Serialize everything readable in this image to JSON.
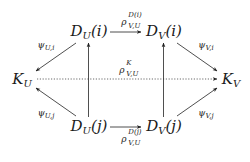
{
  "diagram": {
    "type": "commutative-diagram",
    "nodes": {
      "DUi": {
        "base": "D",
        "sub": "U",
        "arg": "(i)"
      },
      "DVi": {
        "base": "D",
        "sub": "V",
        "arg": "(i)"
      },
      "KU": {
        "base": "K",
        "sub": "U",
        "arg": ""
      },
      "KV": {
        "base": "K",
        "sub": "V",
        "arg": ""
      },
      "DUj": {
        "base": "D",
        "sub": "U",
        "arg": "(j)"
      },
      "DVj": {
        "base": "D",
        "sub": "V",
        "arg": "(j)"
      }
    },
    "edges": [
      {
        "from": "DUi",
        "to": "DVi",
        "style": "solid",
        "label": "ρ^{D(i)}_{V,U}"
      },
      {
        "from": "DUj",
        "to": "DVj",
        "style": "solid",
        "label": "ρ^{D(j)}_{V,U}"
      },
      {
        "from": "KU",
        "to": "KV",
        "style": "dotted",
        "label": "ρ^{K}_{V,U}"
      },
      {
        "from": "DUi",
        "to": "KU",
        "style": "solid",
        "label": "ψ_{U,i}"
      },
      {
        "from": "DVi",
        "to": "KV",
        "style": "solid",
        "label": "ψ_{V,i}"
      },
      {
        "from": "DUj",
        "to": "KU",
        "style": "solid",
        "label": "ψ_{U,j}"
      },
      {
        "from": "DVj",
        "to": "KV",
        "style": "solid",
        "label": "ψ_{V,j}"
      },
      {
        "from": "DUj",
        "to": "DUi",
        "style": "solid",
        "label": ""
      },
      {
        "from": "DVj",
        "to": "DVi",
        "style": "solid",
        "label": ""
      }
    ],
    "labels": {
      "rho_top": {
        "sym": "ρ",
        "sup": "D(i)",
        "sub": "V,U"
      },
      "rho_bot": {
        "sym": "ρ",
        "sup": "D(j)",
        "sub": "V,U"
      },
      "rho_K": {
        "sym": "ρ",
        "sup": "K",
        "sub": "V,U"
      },
      "psi_Ui": {
        "sym": "ψ",
        "sub": "U,i"
      },
      "psi_Vi": {
        "sym": "ψ",
        "sub": "V,i"
      },
      "psi_Uj": {
        "sym": "ψ",
        "sub": "U,j"
      },
      "psi_Vj": {
        "sym": "ψ",
        "sub": "V,j"
      }
    }
  }
}
